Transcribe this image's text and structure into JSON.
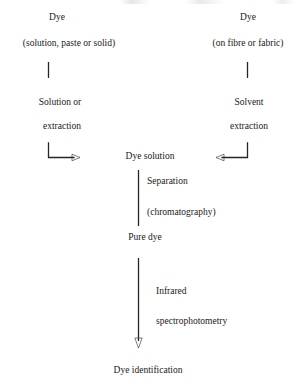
{
  "diagram": {
    "line_color": "#262626",
    "text_color": "#202020",
    "nodes": {
      "left_source": "Dye",
      "left_source_detail": "(solution, paste or solid)",
      "right_source": "Dye",
      "right_source_detail": "(on fibre or fabric)",
      "left_process_line1": "Solution or",
      "left_process_line2": "extraction",
      "right_process_line1": "Solvent",
      "right_process_line2": "extraction",
      "dye_solution": "Dye solution",
      "separation_line1": "Separation",
      "separation_line2": "(chromatography)",
      "pure_dye": "Pure dye",
      "analysis_line1": "Infrared",
      "analysis_line2": "spectrophotometry",
      "dye_identification": "Dye identification"
    }
  }
}
